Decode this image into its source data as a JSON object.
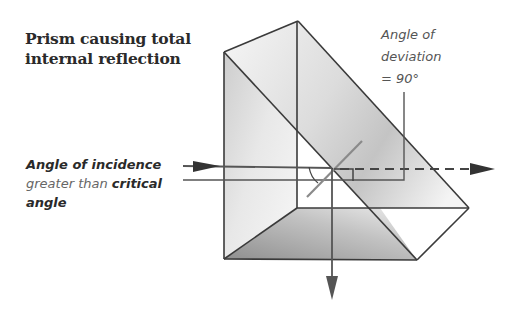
{
  "diagram": {
    "title_line1": "Prism causing total",
    "title_line2": "internal reflection",
    "deviation_label": {
      "line1": "Angle of",
      "line2": "deviation",
      "line3": "= 90°"
    },
    "incidence_label": {
      "bold1": "Angle of incidence",
      "light": "greater than ",
      "bold2": "critical",
      "bold3": "angle"
    },
    "components": [
      "right-angled glass prism",
      "incident ray",
      "normal line",
      "reflected ray (downward)",
      "undeviated dashed path",
      "right-angle marker",
      "angle of incidence arc"
    ],
    "colors": {
      "outline": "#3a3a3a",
      "ray": "#555555",
      "prism_light": "#f2f2f2",
      "prism_dark": "#9a9a9a"
    }
  }
}
